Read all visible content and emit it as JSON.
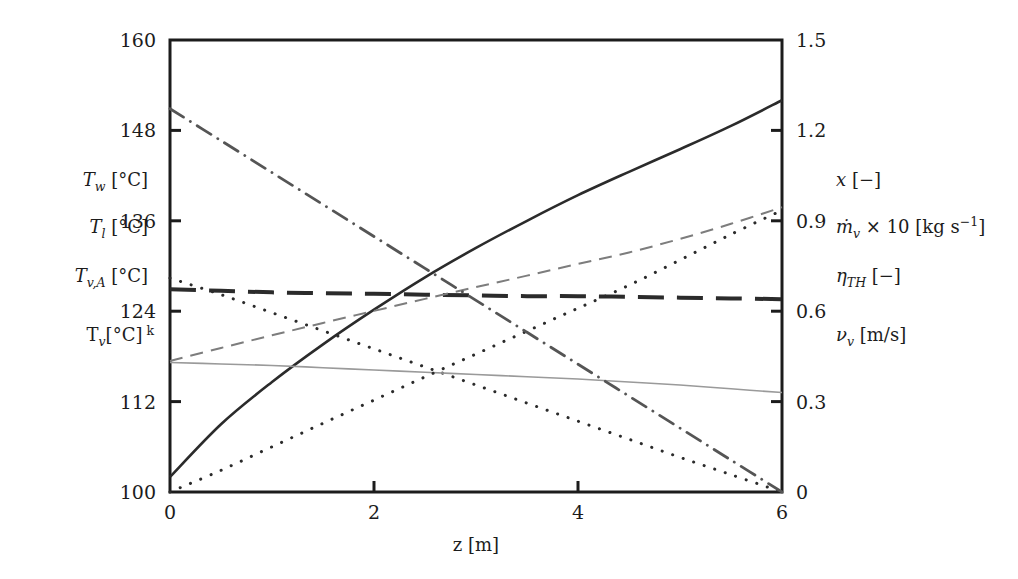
{
  "figure": {
    "background": "#ffffff",
    "ink": "#1c1c1c",
    "plot_box": {
      "left": 170,
      "right": 782,
      "top": 40,
      "bottom": 492
    }
  },
  "axes": {
    "x": {
      "label": "z [m]",
      "ticks": [
        "0",
        "2",
        "4",
        "6"
      ],
      "tick_values": [
        0,
        2,
        4,
        6
      ],
      "range": [
        0,
        6
      ]
    },
    "y_left": {
      "ticks": [
        "100",
        "112",
        "124",
        "136",
        "148",
        "160"
      ],
      "tick_values": [
        100,
        112,
        124,
        136,
        148,
        160
      ],
      "range": [
        100,
        160
      ]
    },
    "y_right": {
      "ticks": [
        "0",
        "0.3",
        "0.6",
        "0.9",
        "1.2",
        "1.5"
      ],
      "tick_values": [
        0,
        0.3,
        0.6,
        0.9,
        1.2,
        1.5
      ],
      "range": [
        0,
        1.5
      ]
    }
  },
  "left_labels": [
    {
      "id": "Tw",
      "base": "T",
      "sub": "w",
      "unit": "[°C]",
      "extra": ""
    },
    {
      "id": "Tl",
      "base": "T",
      "sub": "l",
      "unit": "[°C]",
      "extra": ""
    },
    {
      "id": "TvA",
      "base": "T",
      "sub": "v,A",
      "unit": "[°C]",
      "extra": ""
    },
    {
      "id": "Tv",
      "base": "T",
      "sub": "v",
      "unit": "[°C]",
      "extra": "k"
    }
  ],
  "right_labels": [
    {
      "id": "x",
      "text_main": "x",
      "sub": "",
      "tail": " [−]"
    },
    {
      "id": "mdot",
      "text_main": "ṁ",
      "sub": "v",
      "tail": " × 10 [kg s⁻¹]"
    },
    {
      "id": "eta",
      "text_main": "η",
      "sub": "TH",
      "tail": " [−]"
    },
    {
      "id": "vv",
      "text_main": "ν",
      "sub": "v",
      "tail": " [m/s]"
    }
  ],
  "chart_data": {
    "type": "line",
    "title": "",
    "xlabel": "z [m]",
    "ylabel_left": "T [°C]",
    "ylabel_right": "x [−] / ṁ × 10 [kg s⁻¹] / η [−] / ν [m/s]",
    "xlim": [
      0,
      6
    ],
    "ylim_left": [
      100,
      160
    ],
    "ylim_right": [
      0,
      1.5
    ],
    "grid": false,
    "legend": "none",
    "x": [
      0,
      0.5,
      1,
      1.5,
      2,
      2.5,
      3,
      3.5,
      4,
      4.5,
      5,
      5.5,
      6
    ],
    "series": [
      {
        "name": "T_w",
        "axis": "left",
        "style": "solid",
        "stroke": "#2b2b2b",
        "width": 2.6,
        "values": [
          102.0,
          109.0,
          114.6,
          119.6,
          124.2,
          128.5,
          132.4,
          136.0,
          139.4,
          142.5,
          145.5,
          148.6,
          152.0
        ]
      },
      {
        "name": "T_l",
        "axis": "left",
        "style": "dashed-thick",
        "stroke": "#2b2b2b",
        "width": 4.0,
        "values": [
          126.9,
          126.7,
          126.5,
          126.4,
          126.3,
          126.2,
          126.1,
          126.0,
          126.0,
          125.9,
          125.8,
          125.7,
          125.6
        ]
      },
      {
        "name": "T_v,A",
        "axis": "left",
        "style": "dotted-desc",
        "stroke": "#2b2b2b",
        "width": 3.0,
        "values": [
          128.4,
          126.2,
          123.8,
          121.4,
          119.0,
          116.6,
          114.2,
          111.8,
          109.4,
          107.0,
          104.6,
          102.3,
          100.0
        ]
      },
      {
        "name": "T_v",
        "axis": "left",
        "style": "thin-solid-gray",
        "stroke": "#9a9a9a",
        "width": 1.6,
        "values": [
          117.2,
          117.0,
          116.8,
          116.5,
          116.2,
          115.9,
          115.6,
          115.3,
          115.0,
          114.6,
          114.2,
          113.7,
          113.2
        ]
      },
      {
        "name": "x",
        "axis": "right",
        "style": "dashed-thin",
        "stroke": "#7d7d7d",
        "width": 2.0,
        "values": [
          0.435,
          0.478,
          0.52,
          0.561,
          0.601,
          0.641,
          0.68,
          0.718,
          0.757,
          0.795,
          0.84,
          0.89,
          0.945
        ]
      },
      {
        "name": "mdot_v x 10",
        "axis": "right",
        "style": "dotted-asc",
        "stroke": "#2b2b2b",
        "width": 3.0,
        "values": [
          0.0,
          0.072,
          0.15,
          0.228,
          0.305,
          0.382,
          0.458,
          0.534,
          0.61,
          0.686,
          0.77,
          0.855,
          0.935
        ]
      },
      {
        "name": "nu_v",
        "axis": "right",
        "style": "dashdot",
        "stroke": "#555555",
        "width": 2.8,
        "values": [
          1.272,
          1.166,
          1.06,
          0.954,
          0.848,
          0.742,
          0.636,
          0.53,
          0.424,
          0.318,
          0.212,
          0.106,
          0.0
        ]
      }
    ]
  }
}
